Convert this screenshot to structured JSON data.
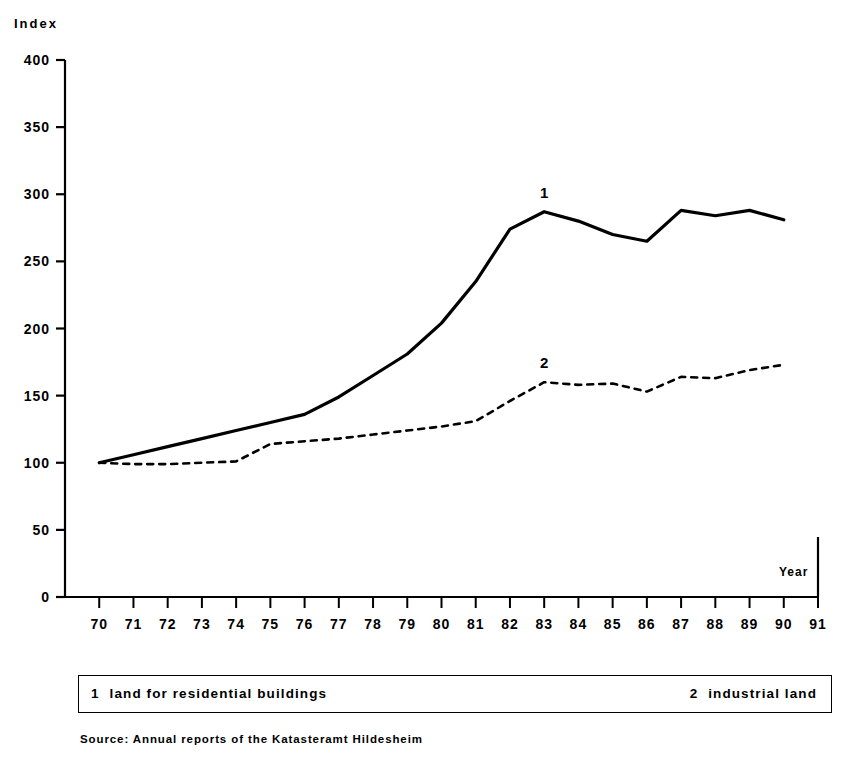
{
  "axes": {
    "y_title": "Index",
    "x_title": "Year"
  },
  "legend": {
    "entry1_key": "1",
    "entry1_label": "land for residential buildings",
    "entry2_key": "2",
    "entry2_label": "industrial land"
  },
  "source": "Source: Annual reports of the Katasteramt Hildesheim",
  "series_labels": {
    "one": "1",
    "two": "2"
  },
  "colors": {
    "ink": "#000000",
    "background": "#ffffff"
  },
  "chart_data": {
    "type": "line",
    "title": "",
    "xlabel": "Year",
    "ylabel": "Index",
    "xlim": [
      69,
      91
    ],
    "ylim": [
      0,
      400
    ],
    "yticks": [
      0,
      50,
      100,
      150,
      200,
      250,
      300,
      350,
      400
    ],
    "xticks": [
      70,
      71,
      72,
      73,
      74,
      75,
      76,
      77,
      78,
      79,
      80,
      81,
      82,
      83,
      84,
      85,
      86,
      87,
      88,
      89,
      90,
      91
    ],
    "xtick_labels": [
      "70",
      "71",
      "72",
      "73",
      "74",
      "75",
      "76",
      "77",
      "78",
      "79",
      "80",
      "81",
      "82",
      "83",
      "84",
      "85",
      "86",
      "87",
      "88",
      "89",
      "90",
      "91"
    ],
    "grid": false,
    "legend_position": "below-plot",
    "x": [
      70,
      71,
      72,
      73,
      74,
      75,
      76,
      77,
      78,
      79,
      80,
      81,
      82,
      83,
      84,
      85,
      86,
      87,
      88,
      89,
      90
    ],
    "series": [
      {
        "name": "land for residential buildings",
        "key": "1",
        "style": "solid",
        "label_at_x": 83,
        "values": [
          100,
          106,
          112,
          118,
          124,
          130,
          136,
          149,
          165,
          181,
          204,
          235,
          274,
          287,
          280,
          270,
          265,
          288,
          284,
          288,
          281
        ]
      },
      {
        "name": "industrial land",
        "key": "2",
        "style": "dashed",
        "label_at_x": 83,
        "values": [
          100,
          99,
          99,
          100,
          101,
          114,
          116,
          118,
          121,
          124,
          127,
          131,
          146,
          160,
          158,
          159,
          153,
          164,
          163,
          169,
          173
        ]
      }
    ]
  }
}
